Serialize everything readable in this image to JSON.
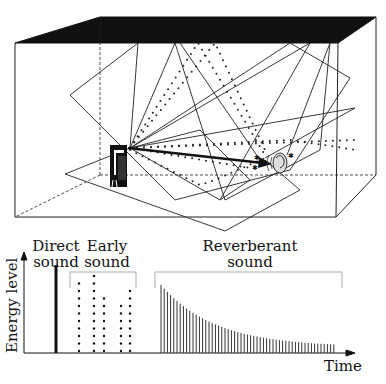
{
  "diagram": {
    "room": {
      "elements": [
        "sound-source",
        "listener-ear",
        "direct-path-arrow",
        "reflection-paths"
      ]
    }
  },
  "labels": {
    "direct_line1": "Direct",
    "direct_line2": "sound",
    "early_line1": "Early",
    "early_line2": "sound",
    "reverb_line1": "Reverberant",
    "reverb_line2": "sound",
    "y_axis": "Energy level",
    "x_axis": "Time"
  },
  "chart_data": {
    "type": "bar",
    "title": "",
    "xlabel": "Time",
    "ylabel": "Energy level",
    "grid": false,
    "series": [
      {
        "name": "Direct sound",
        "x": [
          56
        ],
        "values": [
          88
        ]
      },
      {
        "name": "Early sound",
        "style": "dotted",
        "x": [
          79,
          94,
          104,
          121,
          130
        ],
        "values": [
          70,
          77,
          57,
          47,
          63
        ]
      },
      {
        "name": "Reverberant sound",
        "style": "decaying-lines",
        "count": 55,
        "start_value": 68,
        "end_value": 6
      }
    ]
  }
}
